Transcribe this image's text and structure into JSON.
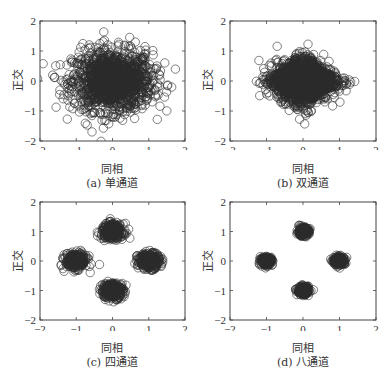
{
  "chart_data": [
    {
      "type": "scatter",
      "title": "(a) 单通道",
      "caption": "(a) 单通道",
      "xlabel": "同相",
      "ylabel": "正交",
      "xlim": [
        -2,
        2
      ],
      "ylim": [
        -2,
        2
      ],
      "xticks": [
        "-2",
        "-1",
        "0",
        "1",
        "2"
      ],
      "yticks": [
        "-2",
        "-1",
        "0",
        "1",
        "2"
      ],
      "marker": "open-circle",
      "grid": false,
      "clusters": [
        {
          "cx": 0,
          "cy": 0,
          "sx": 0.55,
          "sy": 0.5,
          "n": 1400
        }
      ]
    },
    {
      "type": "scatter",
      "title": "(b) 双通道",
      "caption": "(b) 双通道",
      "xlabel": "同相",
      "ylabel": "正交",
      "xlim": [
        -2,
        2
      ],
      "ylim": [
        -2,
        2
      ],
      "xticks": [
        "-2",
        "-1",
        "0",
        "1",
        "2"
      ],
      "yticks": [
        "-2",
        "-1",
        "0",
        "1",
        "2"
      ],
      "marker": "open-circle",
      "grid": false,
      "clusters": [
        {
          "cx": 0,
          "cy": 0,
          "sx": 0.55,
          "sy": 0.5,
          "n": 1400,
          "diamond": true
        }
      ]
    },
    {
      "type": "scatter",
      "title": "(c) 四通道",
      "caption": "(c) 四通道",
      "xlabel": "同相",
      "ylabel": "正交",
      "xlim": [
        -2,
        2
      ],
      "ylim": [
        -2,
        2
      ],
      "xticks": [
        "-2",
        "-1",
        "0",
        "1",
        "2"
      ],
      "yticks": [
        "-2",
        "-1",
        "0",
        "1",
        "2"
      ],
      "marker": "open-circle",
      "grid": false,
      "clusters": [
        {
          "cx": 0,
          "cy": 1,
          "sx": 0.15,
          "sy": 0.13,
          "n": 300
        },
        {
          "cx": -1,
          "cy": 0,
          "sx": 0.15,
          "sy": 0.13,
          "n": 300
        },
        {
          "cx": 1,
          "cy": 0,
          "sx": 0.15,
          "sy": 0.13,
          "n": 300
        },
        {
          "cx": 0,
          "cy": -1,
          "sx": 0.15,
          "sy": 0.13,
          "n": 300
        }
      ]
    },
    {
      "type": "scatter",
      "title": "(d) 八通道",
      "caption": "(d) 八通道",
      "xlabel": "同相",
      "ylabel": "正交",
      "xlim": [
        -2,
        2
      ],
      "ylim": [
        -2,
        2
      ],
      "xticks": [
        "-2",
        "-1",
        "0",
        "1",
        "2"
      ],
      "yticks": [
        "-2",
        "-1",
        "0",
        "1",
        "2"
      ],
      "marker": "open-circle",
      "grid": false,
      "clusters": [
        {
          "cx": 0,
          "cy": 1,
          "sx": 0.08,
          "sy": 0.07,
          "n": 200
        },
        {
          "cx": -1,
          "cy": 0,
          "sx": 0.08,
          "sy": 0.07,
          "n": 200
        },
        {
          "cx": 1,
          "cy": 0,
          "sx": 0.08,
          "sy": 0.07,
          "n": 200
        },
        {
          "cx": 0,
          "cy": -1,
          "sx": 0.08,
          "sy": 0.07,
          "n": 200
        }
      ]
    }
  ]
}
